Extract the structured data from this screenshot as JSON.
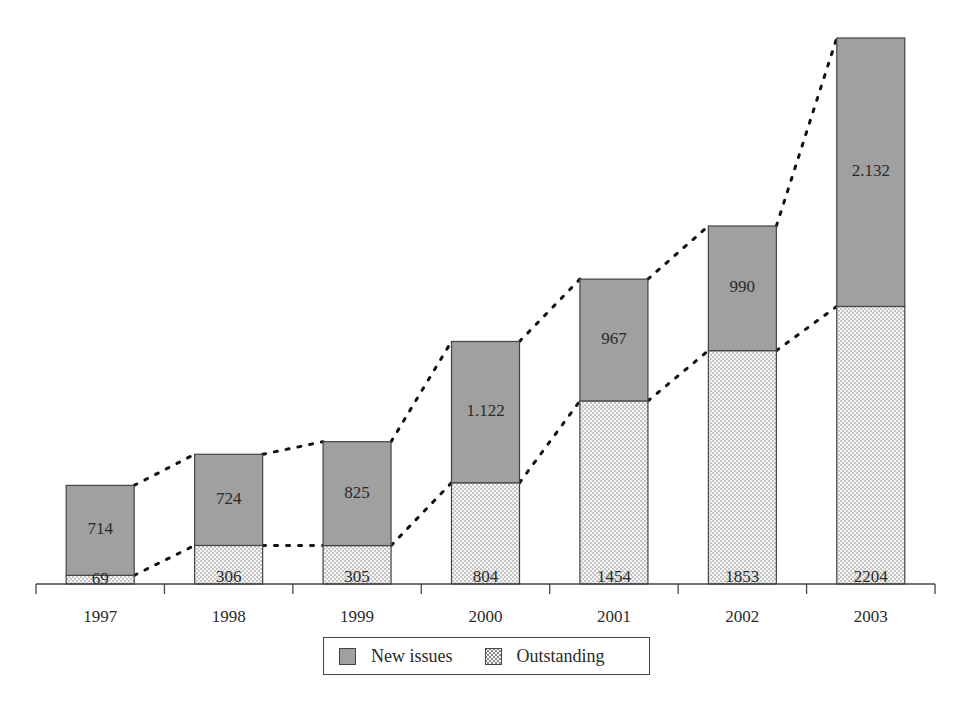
{
  "chart_data": {
    "type": "bar",
    "stacked": true,
    "title": "",
    "xlabel": "",
    "ylabel": "",
    "categories": [
      "1997",
      "1998",
      "1999",
      "2000",
      "2001",
      "2002",
      "2003"
    ],
    "series": [
      {
        "name": "Outstanding",
        "values": [
          69,
          306,
          305,
          804,
          1454,
          1853,
          2204
        ],
        "labels": [
          "69",
          "306",
          "305",
          "804",
          "1454",
          "1853",
          "2204"
        ],
        "pattern": "dotted",
        "color": "#f6f6f6"
      },
      {
        "name": "New issues",
        "values": [
          714,
          724,
          825,
          1122,
          967,
          990,
          2132
        ],
        "labels": [
          "714",
          "724",
          "825",
          "1.122",
          "967",
          "990",
          "2.132"
        ],
        "pattern": "solid",
        "color": "#a0a0a0"
      }
    ],
    "connectors": "dotted lines joining tops of each segment between adjacent bars",
    "grid": false,
    "legend_position": "bottom-center"
  },
  "axis": {
    "tick_labels": [
      "1997",
      "1998",
      "1999",
      "2000",
      "2001",
      "2002",
      "2003"
    ]
  },
  "legend": {
    "items": [
      {
        "label": "New issues",
        "swatch": "solid-gray"
      },
      {
        "label": "Outstanding",
        "swatch": "dotted"
      }
    ]
  },
  "colors": {
    "new_issues": "#a0a0a0",
    "outstanding_bg": "#f6f6f6",
    "outstanding_dot": "#8a8a8a",
    "outline": "#444444"
  }
}
